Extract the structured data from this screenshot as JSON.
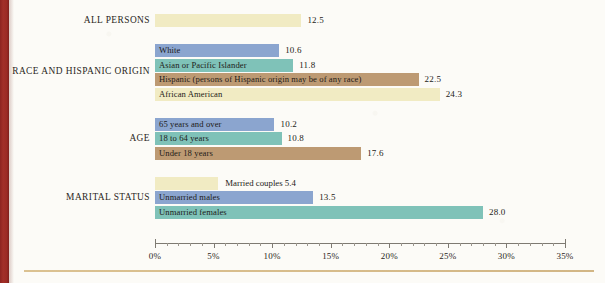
{
  "chart_data": {
    "type": "bar",
    "orientation": "horizontal",
    "title": "",
    "xlabel": "",
    "ylabel": "",
    "xlim": [
      0,
      35
    ],
    "xticks": [
      0,
      5,
      10,
      15,
      20,
      25,
      30,
      35
    ],
    "xtick_labels": [
      "0%",
      "5%",
      "10%",
      "15%",
      "20%",
      "25%",
      "30%",
      "35%"
    ],
    "minor_tick_step": 1,
    "grid": false,
    "legend": "none",
    "value_unit": "percent",
    "groups": [
      {
        "label": "ALL PERSONS",
        "bars": [
          {
            "label": "",
            "value": 12.5,
            "value_text": "12.5",
            "color": "#f1ebc3",
            "label_inside": false
          }
        ]
      },
      {
        "label": "RACE AND HISPANIC ORIGIN",
        "bars": [
          {
            "label": "White",
            "value": 10.6,
            "value_text": "10.6",
            "color": "#8ba5cf",
            "label_inside": true
          },
          {
            "label": "Asian or Pacific Islander",
            "value": 11.8,
            "value_text": "11.8",
            "color": "#7fc2b8",
            "label_inside": true
          },
          {
            "label": "Hispanic (persons of Hispanic origin may be of any race)",
            "value": 22.5,
            "value_text": "22.5",
            "color": "#bd9a73",
            "label_inside": true
          },
          {
            "label": "African American",
            "value": 24.3,
            "value_text": "24.3",
            "color": "#f1ebc3",
            "label_inside": true
          }
        ]
      },
      {
        "label": "AGE",
        "bars": [
          {
            "label": "65 years and over",
            "value": 10.2,
            "value_text": "10.2",
            "color": "#8ba5cf",
            "label_inside": true
          },
          {
            "label": "18 to 64 years",
            "value": 10.8,
            "value_text": "10.8",
            "color": "#7fc2b8",
            "label_inside": true
          },
          {
            "label": "Under 18 years",
            "value": 17.6,
            "value_text": "17.6",
            "color": "#bd9a73",
            "label_inside": true
          }
        ]
      },
      {
        "label": "MARITAL STATUS",
        "bars": [
          {
            "label": "Married couples",
            "value": 5.4,
            "value_text": "5.4",
            "color": "#f1ebc3",
            "label_inside": false,
            "outside_text": "Married couples 5.4"
          },
          {
            "label": "Unmarried males",
            "value": 13.5,
            "value_text": "13.5",
            "color": "#8ba5cf",
            "label_inside": true
          },
          {
            "label": "Unmarried females",
            "value": 28.0,
            "value_text": "28.0",
            "color": "#7fc2b8",
            "label_inside": true
          }
        ]
      }
    ]
  },
  "decor": {
    "left_stripe_color": "#9b2a24",
    "bottom_rule_color": "#d2b47e",
    "page_background": "#fcfbf7"
  }
}
